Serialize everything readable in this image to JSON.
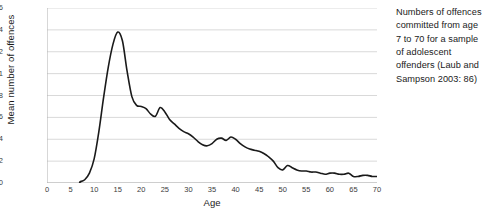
{
  "caption": {
    "text": "Numbers of offences committed from age 7 to 70 for a sample of adolescent offenders (Laub and Sampson 2003: 86)"
  },
  "colors": {
    "line": "#1a1a1a",
    "grid": "#d9d9d9",
    "axis": "#b0b0b0",
    "tick_text": "#3c3c3c",
    "background": "#ffffff"
  },
  "chart_data": {
    "type": "line",
    "title": "",
    "xlabel": "Age",
    "ylabel": "Mean number of offences",
    "xlim": [
      0,
      70
    ],
    "ylim": [
      0,
      1.6
    ],
    "grid": true,
    "legend": "none",
    "xticks": [
      0,
      5,
      10,
      15,
      20,
      25,
      30,
      35,
      40,
      45,
      50,
      55,
      60,
      65,
      70
    ],
    "xtick_labels": [
      "0",
      "5",
      "10",
      "15",
      "20",
      "25",
      "30",
      "35",
      "40",
      "45",
      "50",
      "55",
      "60",
      "65",
      "70"
    ],
    "yticks": [
      0,
      0.2,
      0.4,
      0.6,
      0.8,
      1,
      1.2,
      1.4,
      1.6
    ],
    "ytick_labels": [
      "0",
      "0.2",
      "0.4",
      "0.6",
      "0.8",
      "1",
      "1.2",
      "1.4",
      "1.6"
    ],
    "series": [
      {
        "name": "Mean number of offences",
        "x": [
          7,
          8,
          9,
          10,
          11,
          12,
          13,
          14,
          15,
          16,
          17,
          18,
          19,
          20,
          21,
          22,
          23,
          24,
          25,
          26,
          27,
          28,
          29,
          30,
          31,
          32,
          33,
          34,
          35,
          36,
          37,
          38,
          39,
          40,
          41,
          42,
          43,
          44,
          45,
          46,
          47,
          48,
          49,
          50,
          51,
          52,
          53,
          54,
          55,
          56,
          57,
          58,
          59,
          60,
          61,
          62,
          63,
          64,
          65,
          66,
          67,
          68,
          69,
          70
        ],
        "y": [
          0.01,
          0.03,
          0.09,
          0.22,
          0.47,
          0.78,
          1.06,
          1.27,
          1.38,
          1.3,
          1.02,
          0.79,
          0.71,
          0.7,
          0.68,
          0.63,
          0.61,
          0.69,
          0.65,
          0.58,
          0.54,
          0.5,
          0.47,
          0.45,
          0.42,
          0.38,
          0.35,
          0.34,
          0.36,
          0.4,
          0.41,
          0.39,
          0.42,
          0.4,
          0.36,
          0.33,
          0.31,
          0.3,
          0.29,
          0.27,
          0.24,
          0.2,
          0.14,
          0.12,
          0.16,
          0.14,
          0.12,
          0.11,
          0.11,
          0.1,
          0.1,
          0.09,
          0.08,
          0.09,
          0.09,
          0.08,
          0.08,
          0.09,
          0.06,
          0.06,
          0.07,
          0.07,
          0.06,
          0.06
        ]
      }
    ]
  }
}
